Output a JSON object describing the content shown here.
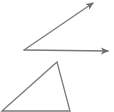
{
  "diagram": {
    "background": "#ffffff",
    "stroke_color": "#7a7a7a",
    "stroke_width": 1.3,
    "angle": {
      "vertex": [
        24,
        50
      ],
      "ray_upper_end": [
        93,
        3
      ],
      "ray_lower_end": [
        108,
        51
      ]
    },
    "triangle": {
      "points": [
        [
          2,
          111
        ],
        [
          57,
          62
        ],
        [
          70,
          111
        ]
      ]
    }
  }
}
